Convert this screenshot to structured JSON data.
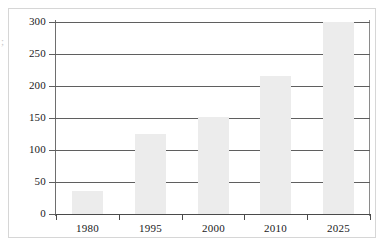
{
  "chart_data": {
    "type": "bar",
    "title": "",
    "subtitle": "",
    "xlabel": "",
    "ylabel": "",
    "categories": [
      "1980",
      "1995",
      "2000",
      "2010",
      "2025"
    ],
    "values": [
      36,
      125,
      152,
      215,
      300
    ],
    "series": [
      {
        "name": "",
        "values": [
          36,
          125,
          152,
          215,
          300
        ]
      }
    ],
    "ylim": [
      0,
      300
    ],
    "y_ticks": [
      0,
      50,
      100,
      150,
      200,
      250,
      300
    ],
    "y_tick_labels": [
      "0",
      "50",
      "100",
      "150",
      "200",
      "250",
      "300"
    ],
    "x_tick_labels": [
      "1980",
      "1995",
      "2000",
      "2010",
      "2025"
    ],
    "grid": true,
    "grid_axis": "y",
    "legend": false,
    "legend_position": "none",
    "annotations": [],
    "bar_color": "#ececec",
    "axis_color": "#4a4a4a",
    "gridline_color": "#5f5f5f",
    "frame_color": "#d6d6d6",
    "background_color": "#ffffff"
  },
  "figure": {
    "edge_artifact_text": ";"
  }
}
